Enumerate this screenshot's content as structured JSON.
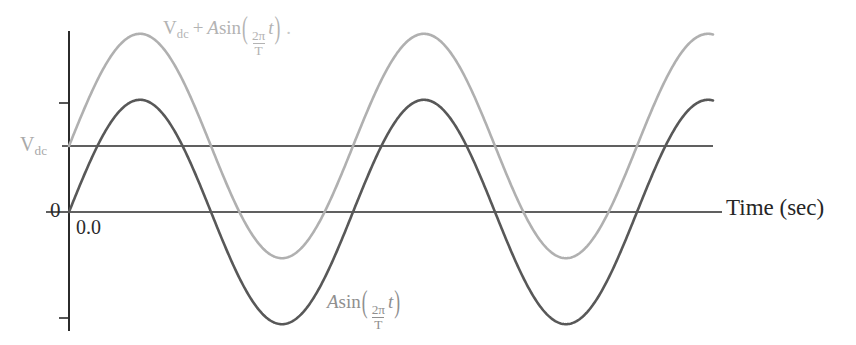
{
  "figure": {
    "width": 856,
    "height": 345,
    "background": "#ffffff"
  },
  "axes": {
    "x_axis_label": "Time (sec)",
    "y_axis_origin_label": "0",
    "x_axis_origin_tick_label": "0.0",
    "dc_level_label_parts": {
      "symbol": "V",
      "subscript": "dc"
    },
    "axis_color": "#2b2b2b",
    "y_axis_x_px": 69,
    "zero_line_y_px": 212,
    "dc_line_y_px": 146,
    "curve_start_x_px": 69,
    "curve_end_x_px": 713
  },
  "labels": {
    "top_curve_formula": {
      "v": "V",
      "v_sub": "dc",
      "plus": "+",
      "amp": "A",
      "fn": "sin",
      "num": "2π",
      "den": "T",
      "var": "t",
      "trailing": "."
    },
    "bottom_curve_formula": {
      "amp": "A",
      "fn": "sin",
      "num": "2π",
      "den": "T",
      "var": "t"
    }
  },
  "chart_data": {
    "type": "line",
    "title": "",
    "xlabel": "Time (sec)",
    "ylabel": "",
    "grid": false,
    "legend_position": "inline-annotations",
    "xlim": [
      0,
      2.27
    ],
    "ylim": [
      -1.6,
      2.6
    ],
    "x_tick_labels": [
      "0.0"
    ],
    "y_tick_labels": [
      "0",
      "Vdc"
    ],
    "reference_lines": [
      {
        "name": "zero-line",
        "y": 0,
        "label": "0",
        "color": "#2b2b2b"
      },
      {
        "name": "dc-line",
        "y": 1.0,
        "label": "Vdc",
        "color": "#2b2b2b"
      }
    ],
    "parameters": {
      "amplitude_A": 1.7,
      "dc_offset_Vdc": 1.0,
      "period_T": 1.0,
      "cycles_shown": 2.27
    },
    "series": [
      {
        "name": "Vdc + A sin(2πt/T)",
        "color": "#b0b0b0",
        "stroke_width": 2.6,
        "formula": "V_dc + A sin(2π t / T)",
        "offset": 1.0,
        "amplitude": 1.7,
        "annotation": "V_dc + Asin(2π/T t)",
        "key_points": {
          "start_value": 1.0,
          "peak_value": 2.7,
          "trough_value": -0.7,
          "peak_x": [
            0.236,
            1.236,
            2.236
          ],
          "trough_x": [
            0.736,
            1.736
          ]
        }
      },
      {
        "name": "A sin(2πt/T)",
        "color": "#585858",
        "stroke_width": 2.6,
        "formula": "A sin(2π t / T)",
        "offset": 0.0,
        "amplitude": 1.7,
        "annotation": "Asin(2π/T t)",
        "key_points": {
          "start_value": 0.0,
          "peak_value": 1.7,
          "trough_value": -1.7,
          "peak_x": [
            0.236,
            1.236,
            2.236
          ],
          "trough_x": [
            0.736,
            1.736
          ]
        }
      }
    ]
  },
  "colors": {
    "light_curve": "#b0b0b0",
    "dark_curve": "#585858",
    "axis": "#2b2b2b",
    "light_text": "#b3b3b3",
    "mid_text": "#8f8f8f",
    "dark_text": "#262626"
  }
}
